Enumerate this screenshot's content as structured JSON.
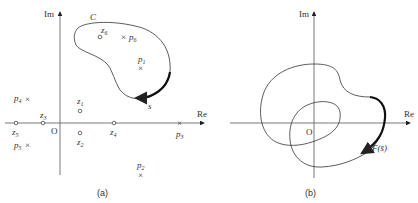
{
  "panel_a": {
    "caption": "(a)",
    "axis_x_label": "Re",
    "axis_y_label": "Im",
    "origin_label": "O",
    "contour_label": "C",
    "direction_label": "s",
    "zeros": [
      {
        "name": "z",
        "sub": "1"
      },
      {
        "name": "z",
        "sub": "2"
      },
      {
        "name": "z",
        "sub": "3"
      },
      {
        "name": "z",
        "sub": "4"
      },
      {
        "name": "z",
        "sub": "5"
      },
      {
        "name": "z",
        "sub": "6"
      }
    ],
    "poles": [
      {
        "name": "p",
        "sub": "1"
      },
      {
        "name": "p",
        "sub": "2"
      },
      {
        "name": "p",
        "sub": "3"
      },
      {
        "name": "p",
        "sub": "4"
      },
      {
        "name": "p",
        "sub": "5"
      },
      {
        "name": "p",
        "sub": "6"
      }
    ]
  },
  "panel_b": {
    "caption": "(b)",
    "axis_x_label": "Re",
    "axis_y_label": "Im",
    "origin_label": "O",
    "mapping_label": "F(s̄)"
  }
}
